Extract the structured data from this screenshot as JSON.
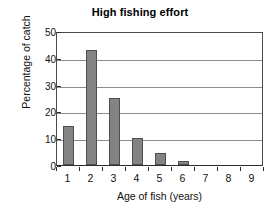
{
  "chart_data": {
    "type": "bar",
    "title": "High fishing effort",
    "xlabel": "Age of fish (years)",
    "ylabel": "Percentage of catch",
    "categories": [
      "1",
      "2",
      "3",
      "4",
      "5",
      "6",
      "7",
      "8",
      "9"
    ],
    "values": [
      14.5,
      43,
      25,
      10,
      4.5,
      1.5,
      0,
      0,
      0
    ],
    "ylim": [
      0,
      50
    ],
    "yticks": [
      0,
      10,
      20,
      30,
      40,
      50
    ],
    "ytick_labels": [
      "0",
      "10",
      "20",
      "30",
      "40",
      "50"
    ],
    "grid": "horizontal",
    "legend": "none",
    "bar_color": "#838383",
    "bar_edge_color": "#4f4f4f",
    "gridline_color": "#8d8d8d",
    "axis_color": "#2c2c2c",
    "background_color": "#ffffff"
  }
}
